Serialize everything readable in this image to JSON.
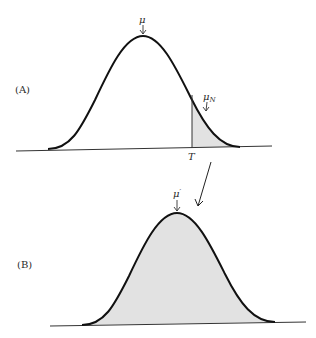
{
  "figure": {
    "colors": {
      "curve": "#111111",
      "axis": "#333333",
      "fill": "#e2e2e2",
      "text": "#2a2a2a"
    },
    "panels": [
      {
        "id": "A",
        "label": "(A)",
        "mean_label": "μ",
        "threshold_label": "T",
        "selected_mean_label": "μ",
        "selected_mean_subscript": "N",
        "shaded_region": "tail beyond T"
      },
      {
        "id": "B",
        "label": "(B)",
        "mean_label": "μ",
        "mean_prime": "′",
        "shaded_region": "entire distribution"
      }
    ],
    "connector": "arrow from panel A selected tail to panel B"
  }
}
